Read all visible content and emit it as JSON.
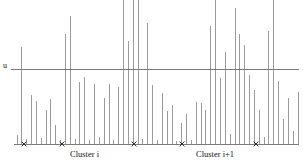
{
  "figure": {
    "type": "stem-plot",
    "background_color": "#ffffff",
    "width": 303,
    "height": 163
  },
  "threshold": {
    "label": "u",
    "y_pixel": 69.5,
    "value": 1.0,
    "color": "#6a6a6a"
  },
  "axis": {
    "baseline_y_pixel": 144,
    "x_start_pixel": 14,
    "x_end_pixel": 299,
    "color": "#6e6e6e"
  },
  "clusters": [
    {
      "label": "Cluster i",
      "label_x_pixel": 70
    },
    {
      "label": "Cluster i+1",
      "label_x_pixel": 196
    }
  ],
  "markers": {
    "glyph": "x",
    "color": "#2a2a2a",
    "x_pixels": [
      24,
      62,
      134,
      182,
      256
    ]
  },
  "chart_data": {
    "type": "bar",
    "title": "",
    "xlabel": "",
    "ylabel": "",
    "grid": false,
    "legend": "none",
    "xlim": [
      0,
      60
    ],
    "ylim": [
      0,
      2.5
    ],
    "threshold_line": 1.0,
    "threshold_label": "u",
    "annotations": [
      {
        "text": "Cluster i",
        "x": 12
      },
      {
        "text": "Cluster i+1",
        "x": 38
      },
      {
        "text": "x",
        "x": 2
      },
      {
        "text": "x",
        "x": 10
      },
      {
        "text": "x",
        "x": 25
      },
      {
        "text": "x",
        "x": 35
      },
      {
        "text": "x",
        "x": 50
      }
    ],
    "categories": [
      0,
      1,
      2,
      3,
      4,
      5,
      6,
      7,
      8,
      9,
      10,
      11,
      12,
      13,
      14,
      15,
      16,
      17,
      18,
      19,
      20,
      21,
      22,
      23,
      24,
      25,
      26,
      27,
      28,
      29,
      30,
      31,
      32,
      33,
      34,
      35,
      36,
      37,
      38,
      39,
      40,
      41,
      42,
      43,
      44,
      45,
      46,
      47,
      48,
      49,
      50,
      51,
      52,
      53,
      54,
      55,
      56,
      57,
      58
    ],
    "values": [
      0.12,
      1.3,
      0.07,
      0.66,
      0.58,
      0.08,
      0.45,
      0.6,
      0.26,
      0.05,
      1.48,
      1.72,
      0.07,
      0.83,
      0.9,
      0.06,
      0.8,
      0.09,
      0.62,
      0.8,
      0.05,
      0.76,
      2.06,
      1.38,
      2.25,
      2.3,
      0.07,
      1.62,
      0.79,
      0.05,
      0.69,
      0.44,
      0.52,
      0.04,
      0.28,
      0.4,
      0.06,
      0.57,
      0.55,
      0.46,
      1.58,
      2.25,
      0.88,
      1.24,
      0.13,
      1.82,
      1.48,
      1.33,
      0.92,
      0.72,
      0.46,
      0.09,
      1.52,
      2.48,
      0.84,
      0.33,
      0.62,
      0.18,
      0.7
    ]
  }
}
